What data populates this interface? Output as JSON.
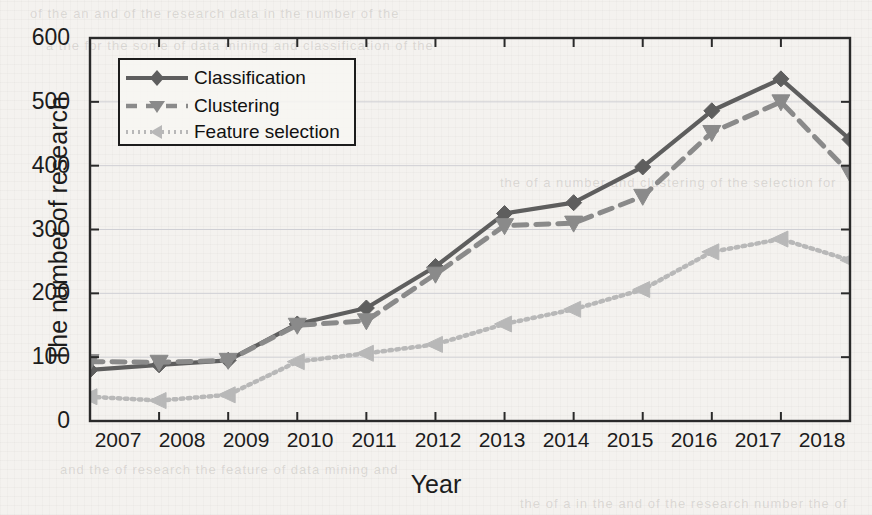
{
  "figure": {
    "background_color": "#f4f2ef",
    "ink_color": "#1c1c1c"
  },
  "axes": {
    "x_label": "Year",
    "y_label": "The number of research",
    "y_ticks": [
      "0",
      "100",
      "200",
      "300",
      "400",
      "500",
      "600"
    ],
    "x_ticks": [
      "2007",
      "2008",
      "2009",
      "2010",
      "2011",
      "2012",
      "2013",
      "2014",
      "2015",
      "2016",
      "2017",
      "2018"
    ]
  },
  "legend": {
    "position": "upper-left-inside",
    "entries": [
      {
        "label": "Classification",
        "marker": "diamond-marker",
        "linestyle": "solid",
        "color": "#5e5e5e"
      },
      {
        "label": "Clustering",
        "marker": "triangle-down-marker",
        "linestyle": "dashed",
        "color": "#8a8a8a"
      },
      {
        "label": "Feature selection",
        "marker": "triangle-left-marker",
        "linestyle": "dotted",
        "color": "#b8b8b8"
      }
    ]
  },
  "chart_data": {
    "type": "line",
    "title": "",
    "xlabel": "Year",
    "ylabel": "The number of research",
    "categories": [
      "2007",
      "2008",
      "2009",
      "2010",
      "2011",
      "2012",
      "2013",
      "2014",
      "2015",
      "2016",
      "2017",
      "2018"
    ],
    "x": [
      2007,
      2008,
      2009,
      2010,
      2011,
      2012,
      2013,
      2014,
      2015,
      2016,
      2017,
      2018
    ],
    "xlim": [
      2007,
      2018
    ],
    "ylim": [
      0,
      600
    ],
    "yticks": [
      0,
      100,
      200,
      300,
      400,
      500,
      600
    ],
    "grid": true,
    "legend_position": "upper left",
    "series": [
      {
        "name": "Classification",
        "color": "#5e5e5e",
        "linestyle": "solid",
        "marker": "diamond",
        "values": [
          80,
          88,
          95,
          152,
          177,
          242,
          325,
          342,
          398,
          486,
          536,
          441
        ]
      },
      {
        "name": "Clustering",
        "color": "#8a8a8a",
        "linestyle": "dashed",
        "marker": "triangle-down",
        "values": [
          93,
          92,
          95,
          150,
          157,
          230,
          306,
          310,
          352,
          452,
          500,
          388
        ]
      },
      {
        "name": "Feature selection",
        "color": "#b8b8b8",
        "linestyle": "dotted",
        "marker": "triangle-left",
        "values": [
          38,
          32,
          41,
          93,
          106,
          120,
          152,
          175,
          206,
          265,
          285,
          252
        ]
      }
    ]
  },
  "ghost_text": {
    "l1": "of the   an   and   of   the   research   data  in  the  number  of  the",
    "l2": "a  the   for  the   some   of   data  mining   and   classification  of  the",
    "l3": "the   of   a   number   and   clustering   of   the   selection   for",
    "l4": "and   the   of   research   the   feature   of   data   mining   and",
    "l5": "the  of  a  in  the  and  of  the  research  number  the  of"
  }
}
